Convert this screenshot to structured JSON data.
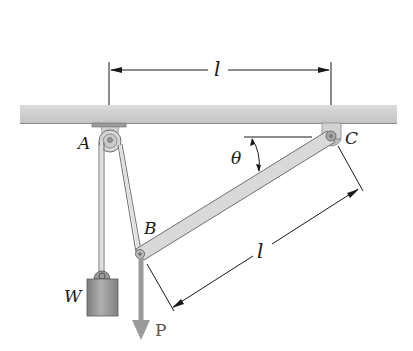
{
  "diagram": {
    "title": "",
    "labels": {
      "point_a": "A",
      "point_b": "B",
      "point_c": "C",
      "weight": "W",
      "force": "P",
      "angle": "θ",
      "length_top": "l",
      "length_bar": "l"
    },
    "colors": {
      "ceiling": "#cfcfcf",
      "ceiling_edge": "#8a8a8a",
      "bar_fill": "#d9d9d9",
      "bar_edge": "#6f6f6f",
      "weight_fill": "#9a9a9a",
      "force_arrow": "#9a9a9a",
      "line": "#1a1a1a"
    },
    "elements": [
      {
        "id": "ceiling",
        "kind": "fixed support"
      },
      {
        "id": "pulley-a",
        "kind": "pulley",
        "label": "A"
      },
      {
        "id": "pin-c",
        "kind": "pin support",
        "label": "C"
      },
      {
        "id": "bar-bc",
        "kind": "rigid bar",
        "from": "B",
        "to": "C"
      },
      {
        "id": "cable",
        "kind": "cable",
        "path": "W over pulley A to B"
      },
      {
        "id": "weight",
        "kind": "hanging mass",
        "label": "W"
      },
      {
        "id": "force-p",
        "kind": "applied force",
        "label": "P",
        "direction": "down"
      },
      {
        "id": "dim-ac",
        "kind": "dimension",
        "label": "l"
      },
      {
        "id": "dim-bc",
        "kind": "dimension",
        "label": "l"
      },
      {
        "id": "angle-theta",
        "kind": "angle",
        "label": "θ"
      }
    ]
  }
}
